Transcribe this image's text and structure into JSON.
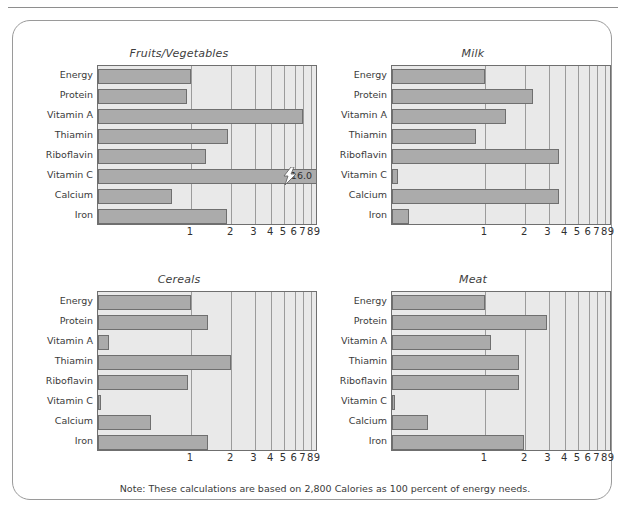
{
  "note": "Note: These calculations are based on 2,800 Calories as 100 percent of energy needs.",
  "colors": {
    "bar_fill": "#ababab",
    "bar_stroke": "#6f6f6f",
    "plot_background": "#e9e9e9",
    "gridline": "#9b9b9b",
    "card_border": "#9a9a9a",
    "text": "#3a3a3a"
  },
  "chart_data": {
    "type": "bar",
    "title": "",
    "orientation": "horizontal",
    "scale": "log",
    "xlabel": "",
    "ylabel": "",
    "xlim": [
      0.2,
      9
    ],
    "xticks": [
      1,
      2,
      3,
      4,
      5,
      6,
      7,
      8,
      9
    ],
    "xtick_labels": [
      "1",
      "2",
      "3",
      "4",
      "5",
      "6",
      "7",
      "8",
      "9"
    ],
    "grid": true,
    "legend": "none",
    "categories": [
      "Energy",
      "Protein",
      "Vitamin A",
      "Thiamin",
      "Riboflavin",
      "Vitamin C",
      "Calcium",
      "Iron"
    ],
    "panels": [
      {
        "title": "Fruits/Vegetables",
        "values": [
          1.0,
          0.93,
          7.0,
          1.9,
          1.3,
          16.0,
          0.72,
          1.85
        ],
        "annotations": [
          {
            "category": "Vitamin C",
            "label": "16.0",
            "clipped": true,
            "break_symbol": "lightning-bolt"
          }
        ]
      },
      {
        "title": "Milk",
        "values": [
          1.0,
          2.3,
          1.45,
          0.85,
          3.6,
          0.22,
          3.6,
          0.27
        ],
        "annotations": []
      },
      {
        "title": "Cereals",
        "values": [
          1.0,
          1.35,
          0.24,
          2.0,
          0.95,
          0.21,
          0.5,
          1.35
        ],
        "annotations": []
      },
      {
        "title": "Meat",
        "values": [
          1.0,
          2.9,
          1.1,
          1.8,
          1.8,
          0.21,
          0.37,
          1.95
        ],
        "annotations": []
      }
    ]
  }
}
